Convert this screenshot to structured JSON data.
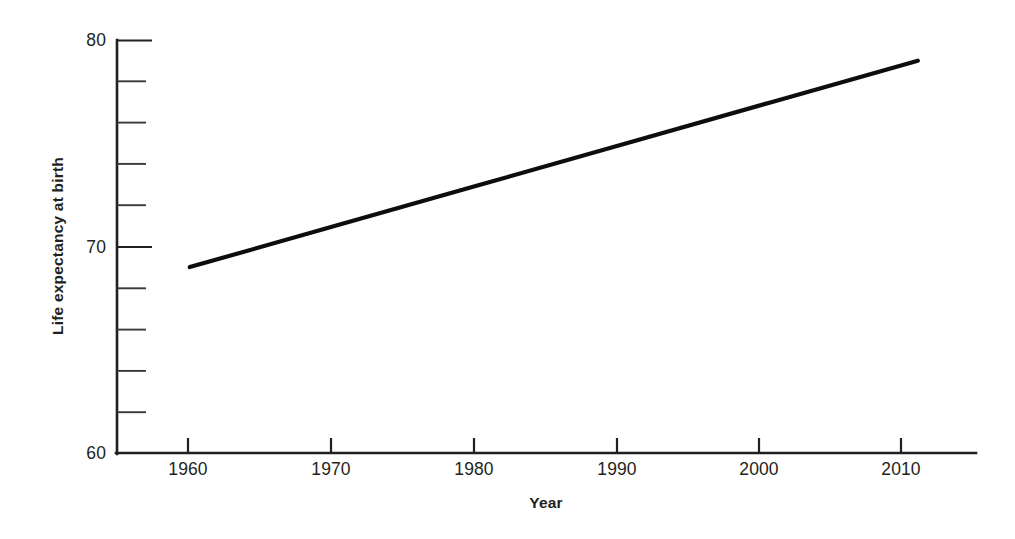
{
  "chart_data": {
    "type": "line",
    "title": "",
    "xlabel": "Year",
    "ylabel": "Life expectancy at birth",
    "xlim": [
      1955,
      2014
    ],
    "ylim": [
      60,
      80
    ],
    "grid": false,
    "legend": null,
    "x_ticks": [
      1960,
      1970,
      1980,
      1990,
      2000,
      2010
    ],
    "x_tick_labels": [
      "1960",
      "1970",
      "1980",
      "1990",
      "2000",
      "2010"
    ],
    "y_ticks": [
      60,
      70,
      80
    ],
    "y_tick_labels": [
      "60",
      "70",
      "80"
    ],
    "y_minor_ticks": [
      62,
      64,
      66,
      68,
      72,
      74,
      76,
      78
    ],
    "series": [
      {
        "name": "Life expectancy at birth",
        "color": "#0d0d0d",
        "x": [
          1960,
          1970,
          1980,
          1990,
          2000,
          2010
        ],
        "values": [
          69.0,
          71.0,
          73.0,
          75.0,
          77.0,
          79.0
        ]
      }
    ]
  },
  "axes": {
    "x_title": "Year",
    "y_title": "Life expectancy at birth"
  },
  "ticks": {
    "x": [
      "1960",
      "1970",
      "1980",
      "1990",
      "2000",
      "2010"
    ],
    "y": [
      "80",
      "70",
      "60"
    ]
  }
}
